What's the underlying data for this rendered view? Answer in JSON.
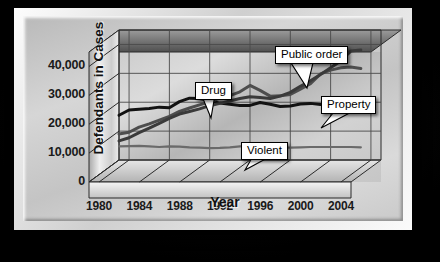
{
  "chart_data": {
    "type": "line",
    "title": "",
    "xlabel": "Year",
    "ylabel": "Defendants in Cases",
    "xlim": [
      1979,
      2005
    ],
    "ylim": [
      0,
      45000
    ],
    "xticks": [
      "1980",
      "1984",
      "1988",
      "1992",
      "1996",
      "2000",
      "2004"
    ],
    "xtick_values": [
      1980,
      1984,
      1988,
      1992,
      1996,
      2000,
      2004
    ],
    "yticks": [
      "0",
      "10,000",
      "20,000",
      "30,000",
      "40,000"
    ],
    "ytick_values": [
      0,
      10000,
      20000,
      30000,
      40000
    ],
    "grid": true,
    "legend_position": "inline-callouts",
    "x": [
      1979,
      1980,
      1981,
      1982,
      1983,
      1984,
      1985,
      1986,
      1987,
      1988,
      1989,
      1990,
      1991,
      1992,
      1993,
      1994,
      1995,
      1996,
      1997,
      1998,
      1999,
      2000,
      2001,
      2002,
      2003
    ],
    "series": [
      {
        "name": "Property",
        "color": "#121212",
        "width": 3.0,
        "values": [
          15500,
          17300,
          17600,
          17800,
          18300,
          18100,
          20200,
          21400,
          21300,
          20500,
          19700,
          19300,
          18900,
          18900,
          19900,
          19300,
          18500,
          18700,
          19400,
          19600,
          19200,
          19300,
          19600,
          19800,
          17600
        ]
      },
      {
        "name": "Drug",
        "color": "#4d4d4d",
        "width": 3.0,
        "values": [
          9000,
          9600,
          11400,
          12500,
          13800,
          15100,
          16800,
          18000,
          19100,
          20100,
          21400,
          22300,
          23600,
          25800,
          24100,
          22100,
          22200,
          22700,
          24500,
          26400,
          29800,
          31100,
          31900,
          32200,
          31700
        ]
      },
      {
        "name": "Public order",
        "color": "#3a3a3a",
        "width": 3.0,
        "values": [
          6600,
          7700,
          9500,
          11000,
          12700,
          14400,
          15900,
          16800,
          17700,
          18800,
          19600,
          20400,
          21300,
          21900,
          21600,
          21300,
          22100,
          23400,
          25500,
          27400,
          29600,
          31900,
          34300,
          37700,
          38100
        ]
      },
      {
        "name": "Violent",
        "color": "#6a6a6a",
        "width": 2.2,
        "values": [
          4700,
          4800,
          4900,
          4700,
          4500,
          4700,
          4600,
          4400,
          4300,
          4100,
          4200,
          4400,
          4700,
          5000,
          4900,
          4600,
          4300,
          4300,
          4400,
          4500,
          4500,
          4500,
          4500,
          4500,
          4400
        ]
      }
    ],
    "callouts": [
      {
        "label": "Public order",
        "box_x": 226,
        "box_y": 16,
        "tip_x": 258,
        "tip_y": 58
      },
      {
        "label": "Drug",
        "box_x": 146,
        "box_y": 52,
        "tip_x": 162,
        "tip_y": 88
      },
      {
        "label": "Property",
        "box_x": 272,
        "box_y": 66,
        "tip_x": 272,
        "tip_y": 98
      },
      {
        "label": "Violent",
        "box_x": 192,
        "box_y": 112,
        "tip_x": 196,
        "tip_y": 140
      }
    ]
  },
  "colors": {
    "background": "#000000",
    "frame_light": "#fdfdfd",
    "frame_mid": "#cfcfcf",
    "plot_plane": "#c8c8c8",
    "axis_text": "#1a1a1a",
    "gridline": "#4a4a4a"
  }
}
